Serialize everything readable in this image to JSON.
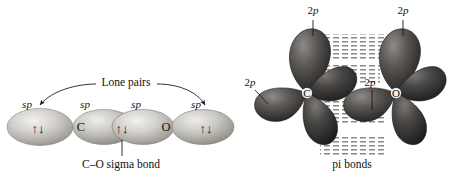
{
  "figure": {
    "background_color": "#ffffff",
    "ink_color": "#111111"
  },
  "left_diagram": {
    "name": "sigma-bond-and-lone-pairs",
    "annotations": {
      "lone_pairs_label": "Lone pairs",
      "sigma_bond_label": "C–O sigma bond"
    },
    "atoms": [
      {
        "symbol": "C",
        "x": 88,
        "y": 127
      },
      {
        "symbol": "O",
        "x": 160,
        "y": 127
      }
    ],
    "hybrid_labels": [
      {
        "text": "sp",
        "x": 27,
        "y": 106
      },
      {
        "text": "sp",
        "x": 82,
        "y": 106
      },
      {
        "text": "sp",
        "x": 132,
        "y": 106
      },
      {
        "text": "sp",
        "x": 190,
        "y": 106
      }
    ],
    "lobes": [
      {
        "name": "lone-pair-lobe-left",
        "cx": 40,
        "cy": 127,
        "rx": 32,
        "ry": 18,
        "electron_pair": true
      },
      {
        "name": "sigma-lobe-carbon",
        "cx": 105,
        "cy": 127,
        "rx": 30,
        "ry": 17,
        "electron_pair": false
      },
      {
        "name": "sigma-lobe-oxygen",
        "cx": 142,
        "cy": 127,
        "rx": 30,
        "ry": 17,
        "electron_pair": true
      },
      {
        "name": "lone-pair-lobe-right",
        "cx": 202,
        "cy": 127,
        "rx": 30,
        "ry": 17,
        "electron_pair": false
      }
    ],
    "electron_pair_symbol": "↑↓"
  },
  "right_diagram": {
    "name": "pi-bonds",
    "annotations": {
      "pi_bonds_label": "pi bonds"
    },
    "atoms": [
      {
        "symbol": "C",
        "x": 307,
        "y": 93
      },
      {
        "symbol": "O",
        "x": 396,
        "y": 93
      }
    ],
    "orbital_labels": [
      {
        "text_prefix": "2",
        "text_italic": "p",
        "x": 313,
        "y": 14,
        "leader": "down"
      },
      {
        "text_prefix": "2",
        "text_italic": "p",
        "x": 401,
        "y": 14,
        "leader": "down"
      },
      {
        "text_prefix": "2",
        "text_italic": "p",
        "x": 250,
        "y": 84,
        "leader": "down-right"
      },
      {
        "text_prefix": "2",
        "text_italic": "p",
        "x": 370,
        "y": 84,
        "leader": "down"
      }
    ],
    "overlap_regions": [
      {
        "name": "pi-overlap-top",
        "x": 322,
        "y": 37,
        "width": 60,
        "height": 22
      },
      {
        "name": "pi-overlap-middle",
        "x": 330,
        "y": 66,
        "width": 48,
        "height": 16
      },
      {
        "name": "pi-overlap-lower",
        "x": 318,
        "y": 104,
        "width": 58,
        "height": 18
      },
      {
        "name": "pi-overlap-bottom",
        "x": 325,
        "y": 140,
        "width": 58,
        "height": 16
      }
    ]
  }
}
